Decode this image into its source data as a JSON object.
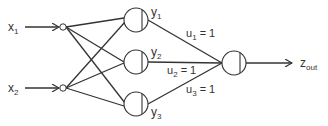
{
  "diagram": {
    "type": "neural-network",
    "inputs": [
      {
        "id": "x1",
        "label": "x",
        "sub": "1"
      },
      {
        "id": "x2",
        "label": "x",
        "sub": "2"
      }
    ],
    "hidden": [
      {
        "id": "y1",
        "label": "y",
        "sub": "1"
      },
      {
        "id": "y2",
        "label": "y",
        "sub": "2"
      },
      {
        "id": "y3",
        "label": "y",
        "sub": "3"
      }
    ],
    "weights": [
      {
        "label": "u",
        "sub": "1",
        "value": " = 1"
      },
      {
        "label": "u",
        "sub": "2",
        "value": " = 1"
      },
      {
        "label": "u",
        "sub": "3",
        "value": " = 1"
      }
    ],
    "output": {
      "label": "z",
      "sub": "out"
    },
    "colors": {
      "stroke": "#333333",
      "background": "#ffffff"
    }
  }
}
